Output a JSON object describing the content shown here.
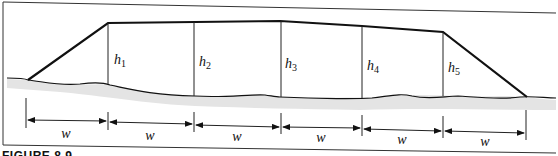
{
  "diagram": {
    "height_labels": [
      {
        "base": "h",
        "sub": "1",
        "x": 110,
        "y": 64
      },
      {
        "base": "h",
        "sub": "2",
        "x": 198,
        "y": 66
      },
      {
        "base": "h",
        "sub": "3",
        "x": 286,
        "y": 68
      },
      {
        "base": "h",
        "sub": "4",
        "x": 367,
        "y": 70
      },
      {
        "base": "h",
        "sub": "5",
        "x": 447,
        "y": 72
      }
    ],
    "width_labels": [
      "w",
      "w",
      "w",
      "w",
      "w",
      "w"
    ],
    "caption": "FIGURE 8.9"
  }
}
